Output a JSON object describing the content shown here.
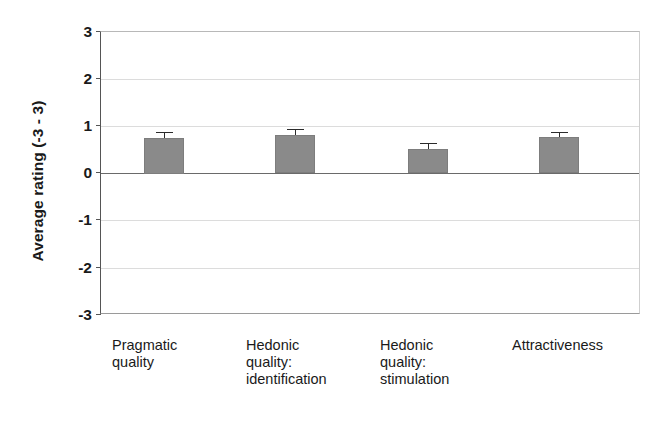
{
  "chart_data": {
    "type": "bar",
    "title": "",
    "xlabel": "",
    "ylabel": "Average rating (-3 - 3)",
    "categories": [
      "Pragmatic quality",
      "Hedonic quality: identification",
      "Hedonic quality: stimulation",
      "Attractiveness"
    ],
    "category_lines": [
      [
        "Pragmatic",
        "quality"
      ],
      [
        "Hedonic",
        "quality:",
        "identification"
      ],
      [
        "Hedonic",
        "quality:",
        "stimulation"
      ],
      [
        "Attractiveness"
      ]
    ],
    "values": [
      0.75,
      0.82,
      0.52,
      0.78
    ],
    "errors": [
      0.13,
      0.12,
      0.12,
      0.11
    ],
    "ylim": [
      -3,
      3
    ],
    "yticks": [
      "3",
      "2",
      "1",
      "0",
      "-1",
      "-2",
      "-3"
    ],
    "ytick_values": [
      3,
      2,
      1,
      0,
      -1,
      -2,
      -3
    ],
    "grid": true,
    "legend": "none",
    "bar_color": "#8a8a8a",
    "gridline_color": "#dcdcdc",
    "zeroline_color": "#6a6a6a",
    "axis_color": "#555555",
    "error_color": "#2b2b2b"
  }
}
